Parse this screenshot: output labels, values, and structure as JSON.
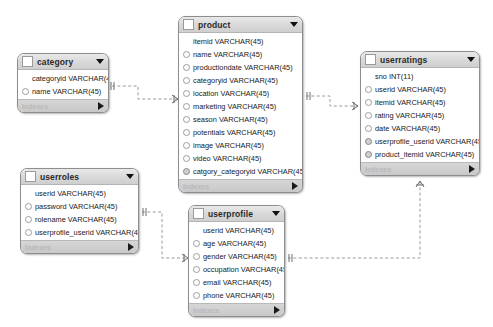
{
  "diagram": {
    "canvas_background": "#ffffff",
    "notation": "crows-foot",
    "line_style": "dashed"
  },
  "icons": {
    "collapse_arrow": "triangle-down-icon",
    "expand_arrow": "triangle-right-icon",
    "header_checkbox": "table-checkbox-icon"
  },
  "tables": [
    {
      "id": "category",
      "name": "category",
      "x": 17,
      "y": 53,
      "width": 92,
      "footer": "Indexes",
      "columns": [
        {
          "name": "categoryid VARCHAR(45)",
          "key": "pk"
        },
        {
          "name": "name VARCHAR(45)",
          "key": "col"
        }
      ]
    },
    {
      "id": "product",
      "name": "product",
      "x": 178,
      "y": 16,
      "width": 125,
      "footer": "Indexes",
      "columns": [
        {
          "name": "itemid VARCHAR(45)",
          "key": "pk"
        },
        {
          "name": "name VARCHAR(45)",
          "key": "col"
        },
        {
          "name": "productiondate VARCHAR(45)",
          "key": "col"
        },
        {
          "name": "categoryid VARCHAR(45)",
          "key": "col"
        },
        {
          "name": "location VARCHAR(45)",
          "key": "col"
        },
        {
          "name": "marketing VARCHAR(45)",
          "key": "col"
        },
        {
          "name": "season VARCHAR(45)",
          "key": "col"
        },
        {
          "name": "potentials VARCHAR(45)",
          "key": "col"
        },
        {
          "name": "image VARCHAR(45)",
          "key": "col"
        },
        {
          "name": "video VARCHAR(45)",
          "key": "col"
        },
        {
          "name": "catgory_categoryid VARCHAR(45)",
          "key": "fk"
        }
      ]
    },
    {
      "id": "userratings",
      "name": "userratings",
      "x": 360,
      "y": 51,
      "width": 120,
      "footer": "Indexes",
      "columns": [
        {
          "name": "sno INT(11)",
          "key": "pk"
        },
        {
          "name": "userid VARCHAR(45)",
          "key": "col"
        },
        {
          "name": "itemid VARCHAR(45)",
          "key": "col"
        },
        {
          "name": "rating VARCHAR(45)",
          "key": "col"
        },
        {
          "name": "date VARCHAR(45)",
          "key": "col"
        },
        {
          "name": "userprofile_userid VARCHAR(45)",
          "key": "fk"
        },
        {
          "name": "product_itemid VARCHAR(45)",
          "key": "fk"
        }
      ]
    },
    {
      "id": "userroles",
      "name": "userroles",
      "x": 20,
      "y": 168,
      "width": 119,
      "footer": "Indexes",
      "columns": [
        {
          "name": "userid VARCHAR(45)",
          "key": "pk"
        },
        {
          "name": "password VARCHAR(45)",
          "key": "col"
        },
        {
          "name": "rolename VARCHAR(45)",
          "key": "col"
        },
        {
          "name": "userprofile_userid VARCHAR(45)",
          "key": "col"
        }
      ]
    },
    {
      "id": "userprofile",
      "name": "userprofile",
      "x": 188,
      "y": 205,
      "width": 97,
      "footer": "Indexes",
      "columns": [
        {
          "name": "userid VARCHAR(45)",
          "key": "pk"
        },
        {
          "name": "age VARCHAR(45)",
          "key": "col"
        },
        {
          "name": "gender VARCHAR(45)",
          "key": "col"
        },
        {
          "name": "occupation VARCHAR(45)",
          "key": "col"
        },
        {
          "name": "email VARCHAR(45)",
          "key": "col"
        },
        {
          "name": "phone VARCHAR(45)",
          "key": "col"
        }
      ]
    }
  ],
  "relationships": [
    {
      "id": "category-product",
      "from": "category",
      "to": "product",
      "type": "one-to-many"
    },
    {
      "id": "product-userratings",
      "from": "product",
      "to": "userratings",
      "type": "one-to-many"
    },
    {
      "id": "userroles-userprofile",
      "from": "userroles",
      "to": "userprofile",
      "type": "one-to-many"
    },
    {
      "id": "userprofile-userratings",
      "from": "userprofile",
      "to": "userratings",
      "type": "one-to-many"
    }
  ]
}
